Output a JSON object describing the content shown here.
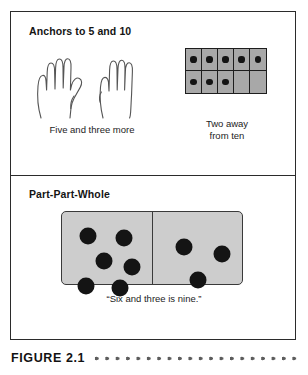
{
  "figure": {
    "caption_label": "FIGURE 2.1",
    "caption_dots_count": 24
  },
  "panels": [
    {
      "id": "anchors",
      "heading": "Anchors to 5 and 10",
      "items": [
        {
          "id": "hands",
          "caption": "Five and three more",
          "illustration": "two-hands",
          "hands": [
            {
              "name": "left-hand",
              "fingers_up": 4,
              "thumb_extended": true,
              "total_shown": 5
            },
            {
              "name": "right-hand",
              "fingers_up": 3,
              "thumb_extended": false,
              "total_shown": 3
            }
          ],
          "value": 8
        },
        {
          "id": "ten-frame",
          "caption": "Two away\nfrom ten",
          "illustration": "ten-frame",
          "columns": 5,
          "rows": 2,
          "filled": [
            [
              true,
              true,
              true,
              true,
              true
            ],
            [
              true,
              true,
              true,
              false,
              false
            ]
          ],
          "filled_count": 8,
          "empty_count": 2
        }
      ]
    },
    {
      "id": "part-part-whole",
      "heading": "Part-Part-Whole",
      "items": [
        {
          "id": "domino",
          "caption": "“Six and three is nine.”",
          "illustration": "domino",
          "left_pips": 6,
          "right_pips": 3,
          "total_pips": 9,
          "left_pip_positions": [
            {
              "x": 26,
              "y": 24
            },
            {
              "x": 62,
              "y": 26
            },
            {
              "x": 42,
              "y": 49
            },
            {
              "x": 70,
              "y": 55
            },
            {
              "x": 24,
              "y": 74
            },
            {
              "x": 58,
              "y": 76
            }
          ],
          "right_pip_positions": [
            {
              "x": 32,
              "y": 35
            },
            {
              "x": 70,
              "y": 42
            },
            {
              "x": 46,
              "y": 68
            }
          ]
        }
      ]
    }
  ],
  "colors": {
    "border": "#2b2b2b",
    "ten_frame_fill": "#a8a8a8",
    "domino_fill": "#cdcdcd",
    "dot": "#141414",
    "text": "#1a1a1a"
  }
}
